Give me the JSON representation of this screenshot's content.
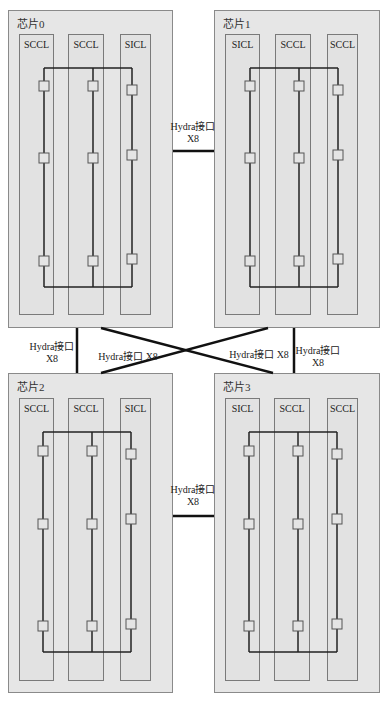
{
  "diagram": {
    "chips": [
      {
        "id": "chip0",
        "title": "芯片0",
        "box": [
          8,
          10,
          165,
          318
        ],
        "clusters": [
          {
            "label": "SCCL",
            "box": [
              19,
              34,
              35,
              281
            ],
            "bus_x": 44,
            "nodes_y": [
              86,
              158,
              261
            ]
          },
          {
            "label": "SCCL",
            "box": [
              68,
              34,
              36,
              281
            ],
            "bus_x": 93,
            "nodes_y": [
              86,
              158,
              261
            ]
          },
          {
            "label": "SICL",
            "box": [
              120,
              34,
              31,
              281
            ],
            "bus_x": 132,
            "nodes_y": [
              90,
              155,
              259
            ]
          }
        ],
        "bus_top_y": 68,
        "bus_bottom_y": 287
      },
      {
        "id": "chip1",
        "title": "芯片1",
        "box": [
          214,
          10,
          166,
          318
        ],
        "clusters": [
          {
            "label": "SICL",
            "box": [
              225,
              34,
              35,
              281
            ],
            "bus_x": 250,
            "nodes_y": [
              86,
              158,
              261
            ]
          },
          {
            "label": "SCCL",
            "box": [
              275,
              34,
              36,
              281
            ],
            "bus_x": 299,
            "nodes_y": [
              86,
              158,
              261
            ]
          },
          {
            "label": "SCCL",
            "box": [
              327,
              34,
              31,
              281
            ],
            "bus_x": 338,
            "nodes_y": [
              90,
              155,
              259
            ]
          }
        ],
        "bus_top_y": 68,
        "bus_bottom_y": 287
      },
      {
        "id": "chip2",
        "title": "芯片2",
        "box": [
          8,
          373,
          165,
          320
        ],
        "clusters": [
          {
            "label": "SCCL",
            "box": [
              19,
              398,
              35,
              283
            ],
            "bus_x": 43,
            "nodes_y": [
              451,
              524,
              626
            ]
          },
          {
            "label": "SCCL",
            "box": [
              68,
              398,
              36,
              283
            ],
            "bus_x": 92,
            "nodes_y": [
              451,
              524,
              626
            ]
          },
          {
            "label": "SICL",
            "box": [
              120,
              398,
              31,
              283
            ],
            "bus_x": 131,
            "nodes_y": [
              454,
              519,
              624
            ]
          }
        ],
        "bus_top_y": 432,
        "bus_bottom_y": 652
      },
      {
        "id": "chip3",
        "title": "芯片3",
        "box": [
          214,
          373,
          166,
          320
        ],
        "clusters": [
          {
            "label": "SICL",
            "box": [
              225,
              398,
              35,
              283
            ],
            "bus_x": 249,
            "nodes_y": [
              451,
              524,
              626
            ]
          },
          {
            "label": "SCCL",
            "box": [
              274,
              398,
              36,
              283
            ],
            "bus_x": 298,
            "nodes_y": [
              451,
              524,
              626
            ]
          },
          {
            "label": "SCCL",
            "box": [
              327,
              398,
              31,
              283
            ],
            "bus_x": 337,
            "nodes_y": [
              454,
              519,
              624
            ]
          }
        ],
        "bus_top_y": 432,
        "bus_bottom_y": 652
      }
    ],
    "links": [
      {
        "from": "chip0",
        "to": "chip1",
        "line": [
          173,
          151,
          214,
          151
        ],
        "label_line1": "Hydra接口",
        "label_line2": "X8",
        "label_pos": [
          193,
          121
        ]
      },
      {
        "from": "chip2",
        "to": "chip3",
        "line": [
          173,
          516,
          214,
          516
        ],
        "label_line1": "Hydra接口",
        "label_line2": "X8",
        "label_pos": [
          193,
          484
        ]
      },
      {
        "from": "chip0",
        "to": "chip2",
        "line": [
          77,
          328,
          77,
          373
        ],
        "label_line1": "Hydra接口",
        "label_line2": "X8",
        "label_pos": [
          52,
          341
        ]
      },
      {
        "from": "chip1",
        "to": "chip3",
        "line": [
          294,
          328,
          294,
          373
        ],
        "label_line1": "Hydra接口",
        "label_line2": "X8",
        "label_pos": [
          318,
          345
        ]
      },
      {
        "from": "chip0",
        "to": "chip3",
        "line": [
          101,
          328,
          273,
          373
        ],
        "label_line1": "Hydra接口 X8",
        "label_line2": "",
        "label_pos": [
          128,
          351
        ]
      },
      {
        "from": "chip1",
        "to": "chip2",
        "line": [
          268,
          328,
          101,
          373
        ],
        "label_line1": "Hydra接口 X8",
        "label_line2": "",
        "label_pos": [
          259,
          349
        ]
      }
    ]
  }
}
